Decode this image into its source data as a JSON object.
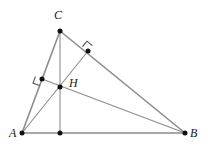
{
  "figure": {
    "canvas": {
      "width": 208,
      "height": 153,
      "background": "#ffffff"
    },
    "colors": {
      "side_stroke": "#8c8c8c",
      "altitude_stroke": "#8c8c8c",
      "point_fill": "#111111",
      "label_color": "#1a1a1a",
      "right_angle_stroke": "#4d4d4d"
    },
    "points": [
      {
        "id": "A",
        "label": "A",
        "x": 22,
        "y": 133,
        "label_x": 9,
        "label_y": 127
      },
      {
        "id": "B",
        "label": "B",
        "x": 185,
        "y": 133,
        "label_x": 190,
        "label_y": 127
      },
      {
        "id": "C",
        "label": "C",
        "x": 60,
        "y": 31,
        "label_x": 54,
        "label_y": 9
      },
      {
        "id": "H",
        "label": "H",
        "x": 60,
        "y": 87,
        "label_x": 69,
        "label_y": 77
      },
      {
        "id": "Fc",
        "label": "",
        "x": 60,
        "y": 133,
        "label_x": 0,
        "label_y": 0
      },
      {
        "id": "Fb",
        "label": "",
        "x": 42,
        "y": 79,
        "label_x": 0,
        "label_y": 0
      },
      {
        "id": "Fa",
        "label": "",
        "x": 88,
        "y": 51,
        "label_x": 0,
        "label_y": 0
      }
    ],
    "sides": [
      {
        "id": "side-AB",
        "name": "AB",
        "x1": 22,
        "y1": 133,
        "x2": 185,
        "y2": 133
      },
      {
        "id": "side-AC",
        "name": "AC",
        "x1": 22,
        "y1": 133,
        "x2": 60,
        "y2": 31
      },
      {
        "id": "side-CB",
        "name": "CB",
        "x1": 60,
        "y1": 31,
        "x2": 185,
        "y2": 133
      }
    ],
    "altitudes": [
      {
        "id": "alt-C",
        "name": "altitude-from-C",
        "x1": 60,
        "y1": 31,
        "x2": 60,
        "y2": 133
      },
      {
        "id": "alt-A",
        "name": "altitude-from-A",
        "x1": 22,
        "y1": 133,
        "x2": 88,
        "y2": 51
      },
      {
        "id": "alt-B",
        "name": "altitude-from-B",
        "x1": 185,
        "y1": 133,
        "x2": 42,
        "y2": 79
      }
    ],
    "right_angles": [
      {
        "id": "ra-Fb",
        "name": "right-angle-at-foot-on-AC",
        "cx": 42,
        "cy": 79,
        "size": 7,
        "rotation": 110
      },
      {
        "id": "ra-Fa",
        "name": "right-angle-at-foot-on-CB",
        "cx": 88,
        "cy": 51,
        "size": 7,
        "rotation": 219
      }
    ]
  }
}
